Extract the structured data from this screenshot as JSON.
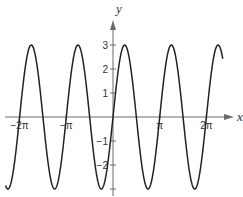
{
  "chart_data": {
    "type": "line",
    "title": "",
    "xlabel": "x",
    "ylabel": "y",
    "function": "y = 3 sin(2x)",
    "amplitude": 3,
    "period_in_pi": 1,
    "x_range_in_pi": [
      -2.3,
      2.35
    ],
    "xlim_in_pi": [
      -2.45,
      2.55
    ],
    "ylim": [
      -3.4,
      4.3
    ],
    "grid": false,
    "legend": "none",
    "x_ticks": [
      {
        "value_in_pi": -2,
        "label": "−2π"
      },
      {
        "value_in_pi": -1,
        "label": "−π"
      },
      {
        "value_in_pi": 1,
        "label": "π"
      },
      {
        "value_in_pi": 2,
        "label": "2π"
      }
    ],
    "y_ticks": [
      {
        "value": 3,
        "label": "3"
      },
      {
        "value": 2,
        "label": "2"
      },
      {
        "value": 1,
        "label": "1"
      },
      {
        "value": -1,
        "label": "−1"
      },
      {
        "value": -2,
        "label": "−2"
      },
      {
        "value": -3,
        "label": ""
      }
    ],
    "series": [
      {
        "name": "3 sin(2x)",
        "color": "#222222"
      }
    ]
  }
}
